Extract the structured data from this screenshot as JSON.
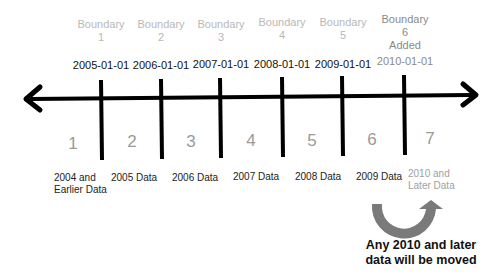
{
  "boundaries": [
    {
      "name": "Boundary",
      "index": "1",
      "date": "2005-01-01",
      "added": ""
    },
    {
      "name": "Boundary",
      "index": "2",
      "date": "2006-01-01",
      "added": ""
    },
    {
      "name": "Boundary",
      "index": "3",
      "date": "2007-01-01",
      "added": ""
    },
    {
      "name": "Boundary",
      "index": "4",
      "date": "2008-01-01",
      "added": ""
    },
    {
      "name": "Boundary",
      "index": "5",
      "date": "2009-01-01",
      "added": ""
    },
    {
      "name": "Boundary",
      "index": "6",
      "date": "2010-01-01",
      "added": "Added"
    }
  ],
  "partitions": [
    {
      "number": "1",
      "label_line1": "2004 and",
      "label_line2": "Earlier Data"
    },
    {
      "number": "2",
      "label_line1": "2005 Data",
      "label_line2": ""
    },
    {
      "number": "3",
      "label_line1": "2006 Data",
      "label_line2": ""
    },
    {
      "number": "4",
      "label_line1": "2007 Data",
      "label_line2": ""
    },
    {
      "number": "5",
      "label_line1": "2008 Data",
      "label_line2": ""
    },
    {
      "number": "6",
      "label_line1": "2009 Data",
      "label_line2": ""
    },
    {
      "number": "7",
      "label_line1": "2010 and",
      "label_line2": "Later Data"
    }
  ],
  "note": {
    "line1": "Any 2010 and later",
    "line2": "data will be moved"
  },
  "colors": {
    "axis": "#000000",
    "inactive_text": "#b8b8b8",
    "active_text": "#8a8a8a",
    "arrow": "#7a7a7a"
  }
}
